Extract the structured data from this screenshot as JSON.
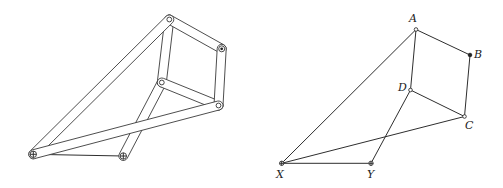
{
  "figure": {
    "width": 503,
    "height": 188,
    "colors": {
      "stroke": "#333333",
      "background": "#ffffff"
    }
  },
  "mechanism": {
    "bar_half_width": 4.5,
    "pivots": {
      "A": {
        "x": 169.3,
        "y": 19.5,
        "type": "pin"
      },
      "B": {
        "x": 221.7,
        "y": 48.8,
        "type": "fixed-dot"
      },
      "C": {
        "x": 218.5,
        "y": 105.5,
        "type": "pin"
      },
      "D": {
        "x": 161.8,
        "y": 82.5,
        "type": "pin"
      },
      "X": {
        "x": 33.3,
        "y": 154.3,
        "type": "ground-cross"
      },
      "Y": {
        "x": 123.3,
        "y": 156.0,
        "type": "ground-cross"
      }
    },
    "bars": [
      {
        "from": "Y",
        "to": "D"
      },
      {
        "from": "A",
        "to": "D"
      },
      {
        "from": "D",
        "to": "C"
      },
      {
        "from": "A",
        "to": "B"
      },
      {
        "from": "B",
        "to": "C"
      },
      {
        "from": "X",
        "to": "A"
      },
      {
        "from": "X",
        "to": "C"
      }
    ],
    "ground_links": [
      {
        "from": "X",
        "to": "Y"
      }
    ]
  },
  "schematic": {
    "points": {
      "A": {
        "x": 416.0,
        "y": 29.5,
        "style": "open",
        "label": "A",
        "lx": 409,
        "ly": 22
      },
      "B": {
        "x": 470.0,
        "y": 55.0,
        "style": "filled",
        "label": "B",
        "lx": 474,
        "ly": 58
      },
      "C": {
        "x": 464.5,
        "y": 116.5,
        "style": "open",
        "label": "C",
        "lx": 465,
        "ly": 129
      },
      "D": {
        "x": 410.5,
        "y": 90.0,
        "style": "open",
        "label": "D",
        "lx": 398,
        "ly": 91
      },
      "X": {
        "x": 281.7,
        "y": 163.3,
        "style": "cross",
        "label": "X",
        "lx": 276,
        "ly": 178
      },
      "Y": {
        "x": 371.0,
        "y": 163.3,
        "style": "cross",
        "label": "Y",
        "lx": 367,
        "ly": 178
      }
    },
    "segments": [
      {
        "from": "X",
        "to": "A"
      },
      {
        "from": "X",
        "to": "C"
      },
      {
        "from": "X",
        "to": "Y"
      },
      {
        "from": "Y",
        "to": "D"
      },
      {
        "from": "A",
        "to": "D"
      },
      {
        "from": "A",
        "to": "B"
      },
      {
        "from": "B",
        "to": "C"
      },
      {
        "from": "D",
        "to": "C"
      }
    ]
  }
}
